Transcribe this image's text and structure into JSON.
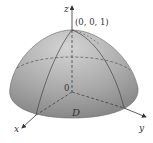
{
  "figure": {
    "labels": {
      "z_axis": "z",
      "x_axis": "x",
      "y_axis": "y",
      "apex": "(0, 0, 1)",
      "origin": "0",
      "region": "D"
    },
    "colors": {
      "surface_light": "#c8c8c8",
      "surface_dark": "#8a8a8a",
      "lines": "#444444",
      "text": "#333333"
    }
  }
}
